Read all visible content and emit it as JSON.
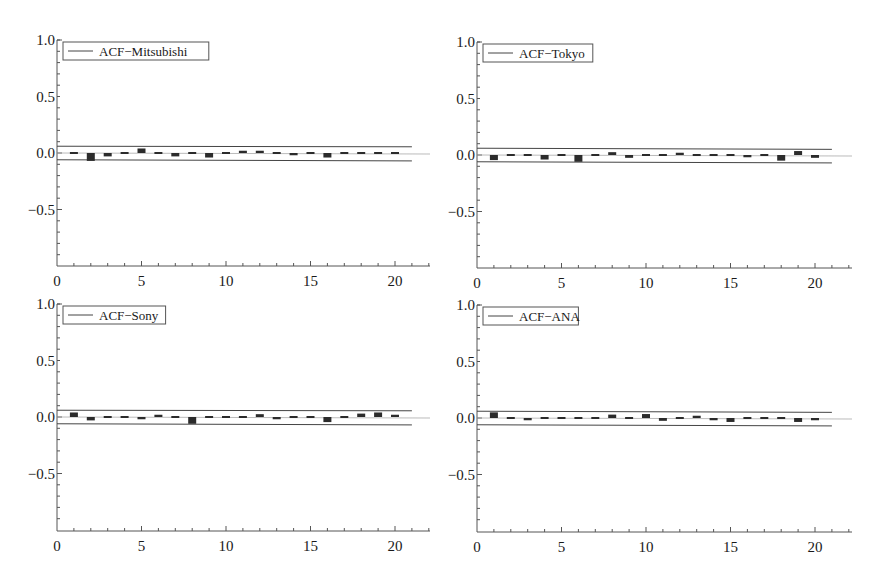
{
  "chart_data": [
    {
      "type": "bar",
      "panel": "top-left",
      "title": "",
      "legend": "ACF−Mitsubishi",
      "legend_placement": "top-left",
      "xlabel": "",
      "ylabel": "",
      "xlim": [
        0,
        22
      ],
      "ylim": [
        -1.0,
        1.0
      ],
      "xticks": [
        "0",
        "5",
        "10",
        "15",
        "20"
      ],
      "yticks": [
        "1.0",
        "0.5",
        "0.0",
        "−0.5"
      ],
      "lags": [
        1,
        2,
        3,
        4,
        5,
        6,
        7,
        8,
        9,
        10,
        11,
        12,
        13,
        14,
        15,
        16,
        17,
        18,
        19,
        20
      ],
      "values": [
        0.005,
        -0.07,
        -0.03,
        -0.01,
        0.04,
        0.0,
        -0.03,
        -0.01,
        -0.04,
        0.0,
        0.02,
        0.02,
        -0.005,
        -0.02,
        -0.01,
        -0.04,
        0.01,
        -0.01,
        -0.015,
        0.015
      ],
      "confidence_band": {
        "upper": [
          0.06,
          0.055
        ],
        "lower": [
          -0.06,
          -0.07
        ],
        "lag_range": [
          0,
          21
        ]
      }
    },
    {
      "type": "bar",
      "panel": "top-right",
      "title": "",
      "legend": "ACF−Tokyo",
      "legend_placement": "top-left",
      "xlabel": "",
      "ylabel": "",
      "xlim": [
        0,
        22
      ],
      "ylim": [
        -1.0,
        1.0
      ],
      "xticks": [
        "0",
        "5",
        "10",
        "15",
        "20"
      ],
      "yticks": [
        "1.0",
        "0.5",
        "0.0",
        "−0.5"
      ],
      "lags": [
        1,
        2,
        3,
        4,
        5,
        6,
        7,
        8,
        9,
        10,
        11,
        12,
        13,
        14,
        15,
        16,
        17,
        18,
        19,
        20
      ],
      "values": [
        -0.045,
        0.0,
        0.015,
        -0.04,
        -0.005,
        -0.06,
        0.015,
        0.025,
        -0.025,
        0.0,
        0.01,
        0.02,
        -0.015,
        -0.005,
        -0.01,
        -0.02,
        0.015,
        -0.05,
        0.035,
        -0.025
      ],
      "confidence_band": {
        "upper": [
          0.06,
          0.05
        ],
        "lower": [
          -0.06,
          -0.07
        ],
        "lag_range": [
          0,
          21
        ]
      }
    },
    {
      "type": "bar",
      "panel": "bottom-left",
      "title": "",
      "legend": "ACF−Sony",
      "legend_placement": "top-left",
      "xlabel": "",
      "ylabel": "",
      "xlim": [
        0,
        22
      ],
      "ylim": [
        -1.0,
        1.0
      ],
      "xticks": [
        "0",
        "5",
        "10",
        "15",
        "20"
      ],
      "yticks": [
        "1.0",
        "0.5",
        "0.0",
        "−0.5"
      ],
      "lags": [
        1,
        2,
        3,
        4,
        5,
        6,
        7,
        8,
        9,
        10,
        11,
        12,
        13,
        14,
        15,
        16,
        17,
        18,
        19,
        20
      ],
      "values": [
        0.04,
        -0.03,
        -0.005,
        0.015,
        -0.02,
        0.02,
        -0.01,
        -0.06,
        -0.01,
        -0.01,
        0.015,
        0.025,
        -0.02,
        0.01,
        -0.015,
        -0.045,
        -0.005,
        0.03,
        0.04,
        0.02
      ],
      "confidence_band": {
        "upper": [
          0.06,
          0.055
        ],
        "lower": [
          -0.06,
          -0.07
        ],
        "lag_range": [
          0,
          21
        ]
      }
    },
    {
      "type": "bar",
      "panel": "bottom-right",
      "title": "",
      "legend": "ACF−ANA",
      "legend_placement": "top-left",
      "xlabel": "",
      "ylabel": "",
      "xlim": [
        0,
        22
      ],
      "ylim": [
        -1.0,
        1.0
      ],
      "xticks": [
        "0",
        "5",
        "10",
        "15",
        "20"
      ],
      "yticks": [
        "1.0",
        "0.5",
        "0.0",
        "−0.5"
      ],
      "lags": [
        1,
        2,
        3,
        4,
        5,
        6,
        7,
        8,
        9,
        10,
        11,
        12,
        13,
        14,
        15,
        16,
        17,
        18,
        19,
        20
      ],
      "values": [
        0.05,
        -0.005,
        -0.02,
        -0.015,
        0.005,
        0.005,
        -0.005,
        0.03,
        0.01,
        0.035,
        -0.025,
        -0.005,
        0.02,
        -0.02,
        -0.035,
        0.005,
        0.015,
        -0.005,
        -0.035,
        -0.02
      ],
      "confidence_band": {
        "upper": [
          0.06,
          0.05
        ],
        "lower": [
          -0.06,
          -0.07
        ],
        "lag_range": [
          0,
          21
        ]
      }
    }
  ],
  "colors": {
    "bar": "#2b2b2b",
    "axis": "#555555",
    "band": "#444444",
    "zero_line": "#aaaaaa",
    "text": "#1a1a1a"
  }
}
